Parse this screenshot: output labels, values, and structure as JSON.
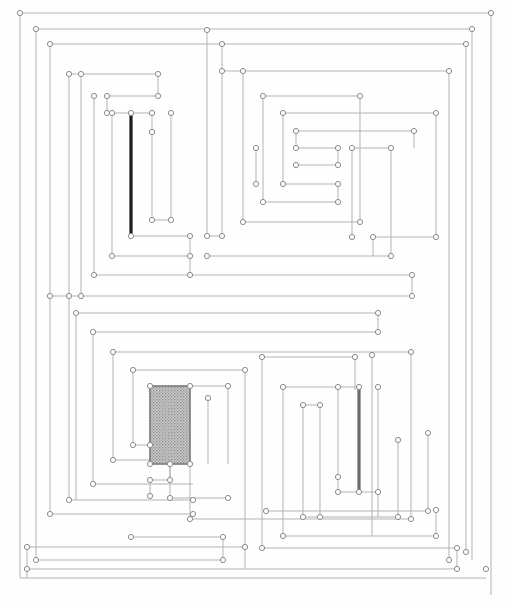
{
  "figure": {
    "width": 511,
    "height": 609,
    "background_color": "#fefefe",
    "line_color": "#b3b3b3",
    "node_fill": "#ffffff",
    "node_stroke": "#8c8c8c",
    "node_radius": 2.6,
    "line_width": 1
  },
  "emphasis": {
    "segments": [
      {
        "name": "thick-black-vertical-upper-left",
        "x": 131,
        "y1": 113,
        "y2": 236,
        "color": "#1a1a1a",
        "width": 3.2
      },
      {
        "name": "thick-gray-vertical-lower-right",
        "x": 359,
        "y1": 387,
        "y2": 492,
        "color": "#6b6b6b",
        "width": 3.2
      }
    ]
  },
  "shaded_block": {
    "name": "hatched-region",
    "x": 150,
    "y": 386,
    "width": 40,
    "height": 78,
    "fill_color": "#b9b9b9",
    "stroke_color": "#6f6f6f",
    "pattern": "fine-dot-hatch"
  },
  "paths": [
    {
      "name": "frame-outer-0",
      "d": "M 20 13 L 491 13 L 491 595"
    },
    {
      "name": "frame-outer-1",
      "d": "M 20 13 L 20 578 L 486 578"
    },
    {
      "name": "frame-outer-2",
      "d": "M 27 569 L 27 578"
    },
    {
      "name": "band-a",
      "d": "M 27 569 L 457 569"
    },
    {
      "name": "band-b",
      "d": "M 27 547 L 27 569"
    },
    {
      "name": "band-c",
      "d": "M 27 547 L 245 547"
    },
    {
      "name": "band-d",
      "d": "M 245 547 L 245 569"
    },
    {
      "name": "ring-1-top",
      "d": "M 36 29 L 472 29"
    },
    {
      "name": "ring-1-left",
      "d": "M 36 29 L 36 560"
    },
    {
      "name": "ring-1-bottom",
      "d": "M 36 560 L 223 560"
    },
    {
      "name": "ring-1-right",
      "d": "M 472 29 L 472 560"
    },
    {
      "name": "ring-2-top",
      "d": "M 50 44 L 466 44"
    },
    {
      "name": "ring-2-left",
      "d": "M 50 44 L 50 296"
    },
    {
      "name": "ring-2-right",
      "d": "M 466 44 L 466 552"
    },
    {
      "name": "ring-3-top",
      "d": "M 69 74 L 158 74"
    },
    {
      "name": "ring-3-left",
      "d": "M 69 74 L 69 296"
    },
    {
      "name": "tl-a",
      "d": "M 158 74 L 158 96"
    },
    {
      "name": "tl-b",
      "d": "M 107 96 L 158 96"
    },
    {
      "name": "tl-c",
      "d": "M 107 96 L 107 113"
    },
    {
      "name": "tl-d",
      "d": "M 107 113 L 152 113"
    },
    {
      "name": "tl-e",
      "d": "M 152 113 L 152 132"
    },
    {
      "name": "tl-f",
      "d": "M 152 132 L 152 132"
    },
    {
      "name": "tl-g",
      "d": "M 131 113 L 131 236"
    },
    {
      "name": "tl-h",
      "d": "M 131 236 L 190 236"
    },
    {
      "name": "tl-i",
      "d": "M 152 132 L 152 220"
    },
    {
      "name": "tl-j",
      "d": "M 152 220 L 171 220"
    },
    {
      "name": "tl-k",
      "d": "M 171 220 L 171 113"
    },
    {
      "name": "tl-l",
      "d": "M 112 113 L 112 256"
    },
    {
      "name": "tl-m",
      "d": "M 112 256 L 190 256"
    },
    {
      "name": "tl-n",
      "d": "M 190 236 L 190 275"
    },
    {
      "name": "tl-o",
      "d": "M 94 96 L 94 275"
    },
    {
      "name": "tl-p",
      "d": "M 94 275 L 190 275"
    },
    {
      "name": "tl-q",
      "d": "M 190 275 L 412 275"
    },
    {
      "name": "tl-r",
      "d": "M 81 74 L 81 296"
    },
    {
      "name": "tl-s",
      "d": "M 81 296 L 412 296"
    },
    {
      "name": "tl-t",
      "d": "M 412 275 L 412 296"
    },
    {
      "name": "tl-u",
      "d": "M 69 296 L 81 296"
    },
    {
      "name": "tl-v",
      "d": "M 50 296 L 69 296"
    },
    {
      "name": "tr-1",
      "d": "M 207 30 L 207 236"
    },
    {
      "name": "tr-2",
      "d": "M 207 236 L 222 236"
    },
    {
      "name": "tr-3",
      "d": "M 222 44 L 222 236"
    },
    {
      "name": "tr-4",
      "d": "M 222 71 L 449 71"
    },
    {
      "name": "tr-5",
      "d": "M 449 71 L 449 560"
    },
    {
      "name": "tr-6",
      "d": "M 243 71 L 243 222"
    },
    {
      "name": "tr-7",
      "d": "M 243 222 L 360 222"
    },
    {
      "name": "tr-8",
      "d": "M 360 96 L 360 222"
    },
    {
      "name": "tr-9",
      "d": "M 263 96 L 360 96"
    },
    {
      "name": "tr-10",
      "d": "M 263 96 L 263 202"
    },
    {
      "name": "tr-11",
      "d": "M 263 202 L 338 202"
    },
    {
      "name": "tr-12",
      "d": "M 283 113 L 436 113"
    },
    {
      "name": "tr-13",
      "d": "M 283 113 L 283 184"
    },
    {
      "name": "tr-14",
      "d": "M 283 184 L 338 184"
    },
    {
      "name": "tr-15",
      "d": "M 338 184 L 338 202"
    },
    {
      "name": "tr-16",
      "d": "M 436 113 L 436 237"
    },
    {
      "name": "tr-17",
      "d": "M 296 131 L 414 131"
    },
    {
      "name": "tr-18",
      "d": "M 296 131 L 296 148"
    },
    {
      "name": "tr-19",
      "d": "M 296 148 L 338 148"
    },
    {
      "name": "tr-20",
      "d": "M 338 148 L 338 165"
    },
    {
      "name": "tr-21",
      "d": "M 296 165 L 338 165"
    },
    {
      "name": "tr-22",
      "d": "M 414 131 L 414 148"
    },
    {
      "name": "tr-23",
      "d": "M 256 148 L 256 184"
    },
    {
      "name": "tr-24",
      "d": "M 352 148 L 391 148"
    },
    {
      "name": "tr-25",
      "d": "M 352 148 L 352 237"
    },
    {
      "name": "tr-26",
      "d": "M 391 148 L 391 256"
    },
    {
      "name": "tr-27",
      "d": "M 373 237 L 436 237"
    },
    {
      "name": "tr-28",
      "d": "M 373 237 L 373 256"
    },
    {
      "name": "tr-29",
      "d": "M 207 256 L 391 256"
    },
    {
      "name": "tr-30",
      "d": "M 256 184 L 256 184"
    },
    {
      "name": "ring-4-left",
      "d": "M 50 296 L 50 514"
    },
    {
      "name": "ring-4-bottom",
      "d": "M 50 514 L 193 514"
    },
    {
      "name": "ring-5-left",
      "d": "M 69 296 L 69 500"
    },
    {
      "name": "ring-5-bottom",
      "d": "M 69 500 L 193 500"
    },
    {
      "name": "bl-1",
      "d": "M 76 313 L 378 313"
    },
    {
      "name": "bl-2",
      "d": "M 76 313 L 76 500"
    },
    {
      "name": "bl-3",
      "d": "M 378 313 L 378 332"
    },
    {
      "name": "bl-4",
      "d": "M 93 332 L 378 332"
    },
    {
      "name": "bl-5",
      "d": "M 93 332 L 93 484"
    },
    {
      "name": "bl-6",
      "d": "M 93 484 L 193 484"
    },
    {
      "name": "bl-7",
      "d": "M 113 352 L 411 352"
    },
    {
      "name": "bl-8",
      "d": "M 113 352 L 113 460"
    },
    {
      "name": "bl-9",
      "d": "M 113 460 L 170 460"
    },
    {
      "name": "bl-10",
      "d": "M 411 352 L 411 519"
    },
    {
      "name": "bl-11",
      "d": "M 133 370 L 245 370"
    },
    {
      "name": "bl-12",
      "d": "M 133 370 L 133 445"
    },
    {
      "name": "bl-13",
      "d": "M 133 445 L 150 445"
    },
    {
      "name": "bl-14",
      "d": "M 150 386 L 190 386"
    },
    {
      "name": "bl-15",
      "d": "M 190 386 L 228 386"
    },
    {
      "name": "bl-16",
      "d": "M 228 386 L 228 464"
    },
    {
      "name": "bl-17",
      "d": "M 150 464 L 190 464"
    },
    {
      "name": "bl-18",
      "d": "M 150 386 L 150 464"
    },
    {
      "name": "bl-19",
      "d": "M 190 386 L 190 464"
    },
    {
      "name": "bl-20",
      "d": "M 170 464 L 170 480"
    },
    {
      "name": "bl-21",
      "d": "M 150 480 L 170 480"
    },
    {
      "name": "bl-22",
      "d": "M 150 480 L 150 496"
    },
    {
      "name": "bl-23",
      "d": "M 170 464 L 170 498"
    },
    {
      "name": "bl-24",
      "d": "M 190 464 L 190 519"
    },
    {
      "name": "bl-25",
      "d": "M 208 398 L 208 464"
    },
    {
      "name": "bl-26",
      "d": "M 245 370 L 245 547"
    },
    {
      "name": "bl-27",
      "d": "M 113 460 L 113 460"
    },
    {
      "name": "bl-28",
      "d": "M 133 445 L 133 445"
    },
    {
      "name": "bl-29",
      "d": "M 170 498 L 228 498"
    },
    {
      "name": "bl-30",
      "d": "M 193 519 L 411 519"
    },
    {
      "name": "bl-31",
      "d": "M 131 537 L 223 537"
    },
    {
      "name": "bl-32",
      "d": "M 223 537 L 223 560"
    },
    {
      "name": "br-1",
      "d": "M 262 357 L 355 357"
    },
    {
      "name": "br-2",
      "d": "M 262 357 L 262 548"
    },
    {
      "name": "br-3",
      "d": "M 355 357 L 355 390"
    },
    {
      "name": "br-4",
      "d": "M 283 387 L 359 387"
    },
    {
      "name": "br-5",
      "d": "M 283 387 L 283 536"
    },
    {
      "name": "br-6",
      "d": "M 359 387 L 359 492"
    },
    {
      "name": "br-7",
      "d": "M 303 405 L 320 405"
    },
    {
      "name": "br-8",
      "d": "M 303 405 L 303 517"
    },
    {
      "name": "br-9",
      "d": "M 320 405 L 320 517"
    },
    {
      "name": "br-10",
      "d": "M 338 387 L 338 492"
    },
    {
      "name": "br-11",
      "d": "M 338 477 L 338 477"
    },
    {
      "name": "br-12",
      "d": "M 338 492 L 378 492"
    },
    {
      "name": "br-13",
      "d": "M 378 387 L 378 517"
    },
    {
      "name": "br-14",
      "d": "M 303 517 L 398 517"
    },
    {
      "name": "br-15",
      "d": "M 398 440 L 398 517"
    },
    {
      "name": "br-16",
      "d": "M 283 536 L 436 536"
    },
    {
      "name": "br-17",
      "d": "M 436 510 L 436 536"
    },
    {
      "name": "br-18",
      "d": "M 262 548 L 457 548"
    },
    {
      "name": "br-19",
      "d": "M 457 548 L 457 569"
    },
    {
      "name": "br-20",
      "d": "M 302 390 L 302 390"
    },
    {
      "name": "br-21",
      "d": "M 372 355 L 372 536"
    },
    {
      "name": "br-22",
      "d": "M 355 390 L 355 390"
    },
    {
      "name": "br-23",
      "d": "M 266 511 L 428 511"
    },
    {
      "name": "br-24",
      "d": "M 428 433 L 428 511"
    }
  ],
  "nodes": [
    {
      "x": 20,
      "y": 13
    },
    {
      "x": 491,
      "y": 13
    },
    {
      "x": 36,
      "y": 29
    },
    {
      "x": 472,
      "y": 29
    },
    {
      "x": 207,
      "y": 30
    },
    {
      "x": 50,
      "y": 44
    },
    {
      "x": 466,
      "y": 44
    },
    {
      "x": 222,
      "y": 44
    },
    {
      "x": 69,
      "y": 74
    },
    {
      "x": 158,
      "y": 74
    },
    {
      "x": 81,
      "y": 74
    },
    {
      "x": 243,
      "y": 71
    },
    {
      "x": 449,
      "y": 71
    },
    {
      "x": 222,
      "y": 71
    },
    {
      "x": 107,
      "y": 96
    },
    {
      "x": 158,
      "y": 96
    },
    {
      "x": 94,
      "y": 96
    },
    {
      "x": 263,
      "y": 96
    },
    {
      "x": 360,
      "y": 96
    },
    {
      "x": 107,
      "y": 113
    },
    {
      "x": 131,
      "y": 113
    },
    {
      "x": 152,
      "y": 113
    },
    {
      "x": 171,
      "y": 113
    },
    {
      "x": 112,
      "y": 113
    },
    {
      "x": 283,
      "y": 113
    },
    {
      "x": 436,
      "y": 113
    },
    {
      "x": 152,
      "y": 132
    },
    {
      "x": 296,
      "y": 131
    },
    {
      "x": 414,
      "y": 131
    },
    {
      "x": 296,
      "y": 148
    },
    {
      "x": 338,
      "y": 148
    },
    {
      "x": 352,
      "y": 148
    },
    {
      "x": 391,
      "y": 148
    },
    {
      "x": 256,
      "y": 148
    },
    {
      "x": 296,
      "y": 165
    },
    {
      "x": 338,
      "y": 165
    },
    {
      "x": 283,
      "y": 184
    },
    {
      "x": 338,
      "y": 184
    },
    {
      "x": 256,
      "y": 184
    },
    {
      "x": 263,
      "y": 202
    },
    {
      "x": 338,
      "y": 202
    },
    {
      "x": 152,
      "y": 220
    },
    {
      "x": 171,
      "y": 220
    },
    {
      "x": 243,
      "y": 222
    },
    {
      "x": 360,
      "y": 222
    },
    {
      "x": 131,
      "y": 236
    },
    {
      "x": 190,
      "y": 236
    },
    {
      "x": 207,
      "y": 236
    },
    {
      "x": 222,
      "y": 236
    },
    {
      "x": 373,
      "y": 237
    },
    {
      "x": 436,
      "y": 237
    },
    {
      "x": 352,
      "y": 237
    },
    {
      "x": 112,
      "y": 256
    },
    {
      "x": 190,
      "y": 256
    },
    {
      "x": 207,
      "y": 256
    },
    {
      "x": 391,
      "y": 256
    },
    {
      "x": 94,
      "y": 275
    },
    {
      "x": 190,
      "y": 275
    },
    {
      "x": 412,
      "y": 275
    },
    {
      "x": 50,
      "y": 296
    },
    {
      "x": 69,
      "y": 296
    },
    {
      "x": 81,
      "y": 296
    },
    {
      "x": 412,
      "y": 296
    },
    {
      "x": 76,
      "y": 313
    },
    {
      "x": 378,
      "y": 313
    },
    {
      "x": 93,
      "y": 332
    },
    {
      "x": 378,
      "y": 332
    },
    {
      "x": 113,
      "y": 352
    },
    {
      "x": 411,
      "y": 352
    },
    {
      "x": 262,
      "y": 357
    },
    {
      "x": 355,
      "y": 357
    },
    {
      "x": 372,
      "y": 355
    },
    {
      "x": 133,
      "y": 370
    },
    {
      "x": 245,
      "y": 370
    },
    {
      "x": 150,
      "y": 386
    },
    {
      "x": 190,
      "y": 386
    },
    {
      "x": 228,
      "y": 386
    },
    {
      "x": 283,
      "y": 387
    },
    {
      "x": 338,
      "y": 387
    },
    {
      "x": 359,
      "y": 387
    },
    {
      "x": 378,
      "y": 387
    },
    {
      "x": 208,
      "y": 398
    },
    {
      "x": 303,
      "y": 405
    },
    {
      "x": 320,
      "y": 405
    },
    {
      "x": 428,
      "y": 433
    },
    {
      "x": 398,
      "y": 440
    },
    {
      "x": 133,
      "y": 445
    },
    {
      "x": 150,
      "y": 445
    },
    {
      "x": 150,
      "y": 464
    },
    {
      "x": 170,
      "y": 464
    },
    {
      "x": 190,
      "y": 464
    },
    {
      "x": 113,
      "y": 460
    },
    {
      "x": 338,
      "y": 477
    },
    {
      "x": 150,
      "y": 480
    },
    {
      "x": 170,
      "y": 480
    },
    {
      "x": 93,
      "y": 484
    },
    {
      "x": 338,
      "y": 492
    },
    {
      "x": 359,
      "y": 492
    },
    {
      "x": 378,
      "y": 492
    },
    {
      "x": 150,
      "y": 496
    },
    {
      "x": 170,
      "y": 498
    },
    {
      "x": 228,
      "y": 498
    },
    {
      "x": 69,
      "y": 500
    },
    {
      "x": 193,
      "y": 500
    },
    {
      "x": 266,
      "y": 511
    },
    {
      "x": 428,
      "y": 511
    },
    {
      "x": 436,
      "y": 510
    },
    {
      "x": 50,
      "y": 514
    },
    {
      "x": 193,
      "y": 514
    },
    {
      "x": 303,
      "y": 517
    },
    {
      "x": 320,
      "y": 517
    },
    {
      "x": 398,
      "y": 517
    },
    {
      "x": 190,
      "y": 519
    },
    {
      "x": 411,
      "y": 519
    },
    {
      "x": 131,
      "y": 537
    },
    {
      "x": 223,
      "y": 537
    },
    {
      "x": 283,
      "y": 536
    },
    {
      "x": 436,
      "y": 536
    },
    {
      "x": 262,
      "y": 548
    },
    {
      "x": 457,
      "y": 548
    },
    {
      "x": 36,
      "y": 560
    },
    {
      "x": 223,
      "y": 560
    },
    {
      "x": 449,
      "y": 560
    },
    {
      "x": 466,
      "y": 552
    },
    {
      "x": 27,
      "y": 547
    },
    {
      "x": 245,
      "y": 547
    },
    {
      "x": 27,
      "y": 569
    },
    {
      "x": 457,
      "y": 569
    },
    {
      "x": 486,
      "y": 569
    }
  ]
}
